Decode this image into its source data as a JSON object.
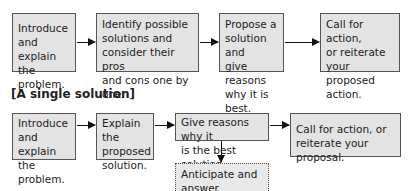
{
  "flow_multiple": {
    "steps": [
      {
        "text": "Introduce\nand explain\nthe problem."
      },
      {
        "text": "Identify possible\nsolutions and\nconsider their pros\nand cons one by one."
      },
      {
        "text": "Propose a\nsolution and\ngive reasons\nwhy it is best."
      },
      {
        "text": "Call for action,\nor reiterate\nyour proposed\naction."
      }
    ]
  },
  "flow_single": {
    "heading": "[A single solution]",
    "steps": [
      {
        "text": "Introduce\nand explain\nthe problem."
      },
      {
        "text": "Explain the\nproposed\nsolution."
      },
      {
        "text": "Give reasons why it\nis the best solution."
      },
      {
        "text": "Call for action, or\nreiterate your proposal."
      }
    ],
    "optional_step": {
      "text": "Anticipate and\nanswer questions."
    }
  }
}
